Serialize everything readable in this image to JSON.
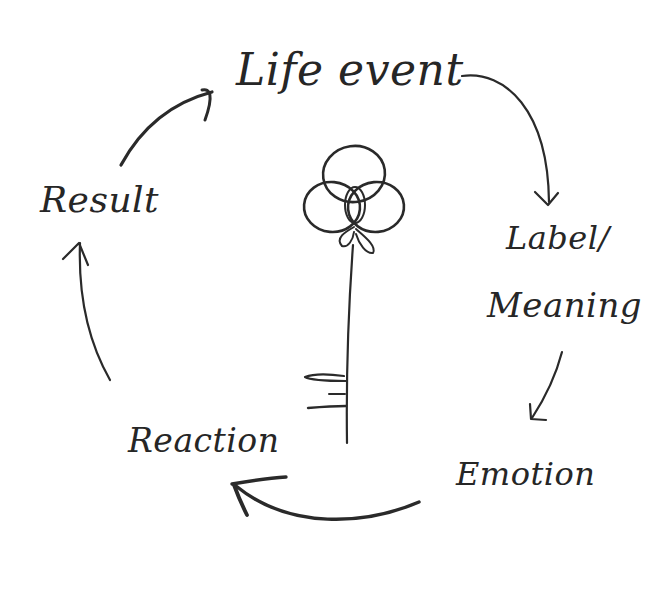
{
  "diagram": {
    "type": "cycle",
    "style": "hand-drawn pencil sketch",
    "nodes": [
      {
        "id": "life_event",
        "label": "Life event"
      },
      {
        "id": "label_meaning",
        "label_line1": "Label/",
        "label_line2": "Meaning"
      },
      {
        "id": "emotion",
        "label": "Emotion"
      },
      {
        "id": "reaction",
        "label": "Reaction"
      },
      {
        "id": "result",
        "label": "Result"
      }
    ],
    "edges": [
      {
        "from": "life_event",
        "to": "label_meaning"
      },
      {
        "from": "label_meaning",
        "to": "emotion"
      },
      {
        "from": "emotion",
        "to": "reaction"
      },
      {
        "from": "reaction",
        "to": "result"
      },
      {
        "from": "result",
        "to": "life_event"
      }
    ],
    "center_icon": "key-icon",
    "colors": {
      "ink": "#2a2a2a",
      "background": "#ffffff"
    }
  }
}
